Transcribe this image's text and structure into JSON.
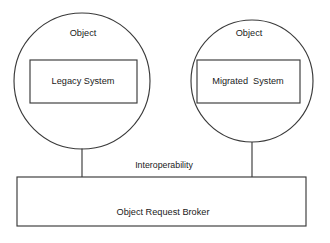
{
  "diagram": {
    "colors": {
      "stroke": "#3a3a3a",
      "text": "#1a1a1a",
      "background": "#ffffff"
    },
    "left_object": {
      "circle_label": "Object",
      "inner_box_label": "Legacy System"
    },
    "right_object": {
      "circle_label": "Object",
      "inner_box_label": "Migrated  System"
    },
    "middle_label": "Interoperability",
    "broker": {
      "label": "Object Request Broker"
    }
  }
}
